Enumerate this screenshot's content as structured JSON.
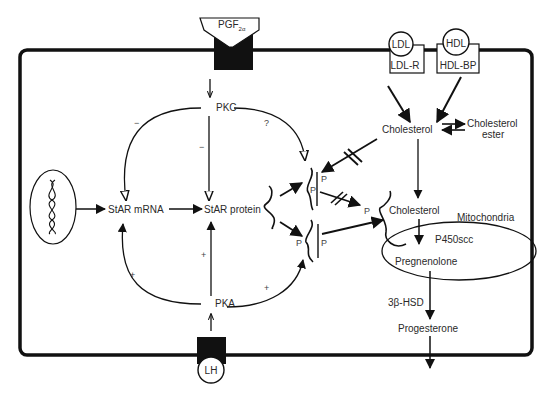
{
  "diagram": {
    "title": "",
    "colors": {
      "line": "#111111",
      "text": "#2a2a2a",
      "background": "#ffffff"
    },
    "receptors": {
      "pgf": {
        "label": "PGF",
        "subscript": "2α"
      },
      "ldl": {
        "ligand": "LDL",
        "receptor": "LDL-R"
      },
      "hdl": {
        "ligand": "HDL",
        "receptor": "HDL-BP"
      },
      "lh": {
        "ligand": "LH"
      }
    },
    "nodes": {
      "pkc": "PKC",
      "pka": "PKA",
      "star_mrna": "StAR mRNA",
      "star_protein": "StAR protein",
      "cholesterol_cyto": "Cholesterol",
      "cholesterol_ester_1": "Cholesterol",
      "cholesterol_ester_2": "ester",
      "cholesterol_mito": "Cholesterol",
      "mitochondria": "Mitochondria",
      "p450scc": "P450scc",
      "pregnenolone": "Pregnenolone",
      "hsd": "3β-HSD",
      "progesterone": "Progesterone"
    },
    "phospho_labels": [
      "P",
      "P",
      "P",
      "P",
      "P"
    ],
    "signs": {
      "pkc_to_mrna": "−",
      "pkc_to_protein": "−",
      "pkc_to_phospho": "?",
      "pka_to_mrna": "+",
      "pka_to_protein": "+",
      "pka_to_phospho": "+"
    },
    "dna_icon": "dna-double-helix"
  }
}
